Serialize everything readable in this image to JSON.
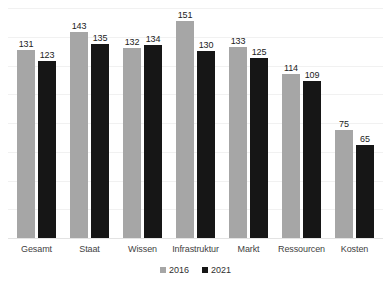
{
  "chart_data": {
    "type": "bar",
    "title": "",
    "subtitle": "",
    "xlabel": "",
    "ylabel": "",
    "ylim": [
      0,
      160
    ],
    "grid": true,
    "legend_position": "bottom",
    "categories": [
      "Gesamt",
      "Staat",
      "Wissen",
      "Infrastruktur",
      "Markt",
      "Ressourcen",
      "Kosten"
    ],
    "series": [
      {
        "name": "2016",
        "color": "#a6a6a6",
        "values": [
          131,
          143,
          132,
          151,
          133,
          114,
          75
        ]
      },
      {
        "name": "2021",
        "color": "#161616",
        "values": [
          123,
          135,
          134,
          130,
          125,
          109,
          65
        ]
      }
    ],
    "data_labels": [
      [
        "131",
        "123"
      ],
      [
        "143",
        "135"
      ],
      [
        "132",
        "134"
      ],
      [
        "151",
        "130"
      ],
      [
        "133",
        "125"
      ],
      [
        "114",
        "109"
      ],
      [
        "75",
        "65"
      ]
    ],
    "tick_labels_y": [],
    "gridline_values": [
      20,
      40,
      60,
      80,
      100,
      120,
      140,
      160
    ]
  },
  "legend": {
    "items": [
      {
        "label": "2016",
        "color": "#a6a6a6",
        "marker": "square-marker"
      },
      {
        "label": "2021",
        "color": "#161616",
        "marker": "square-marker"
      }
    ]
  }
}
